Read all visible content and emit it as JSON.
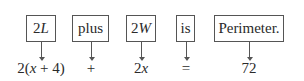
{
  "diagram": {
    "terms": [
      {
        "word": "2L",
        "word_italic_part": "L",
        "word_prefix": "2",
        "expression": "2(x + 4)"
      },
      {
        "word": "plus",
        "expression": "+"
      },
      {
        "word": "2W",
        "word_italic_part": "W",
        "word_prefix": "2",
        "expression": "2x"
      },
      {
        "word": "is",
        "expression": "="
      },
      {
        "word": "Perimeter.",
        "expression": "72"
      }
    ]
  }
}
